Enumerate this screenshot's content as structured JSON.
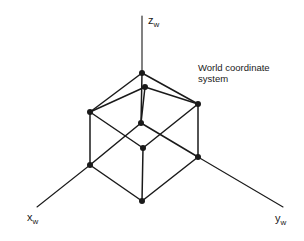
{
  "diagram": {
    "title": "World coordinate system",
    "caption_lines": [
      "World coordinate",
      "system"
    ],
    "axes": {
      "z": {
        "base": "z",
        "sub": "w",
        "label": "z_w",
        "from": [
          142,
          73
        ],
        "to": [
          142,
          16
        ]
      },
      "x": {
        "base": "x",
        "sub": "w",
        "label": "x_w",
        "from": [
          90,
          165
        ],
        "to": [
          37,
          207
        ]
      },
      "y": {
        "base": "y",
        "sub": "w",
        "label": "y_w",
        "from": [
          198,
          157
        ],
        "to": [
          283,
          207
        ]
      }
    },
    "vertices": [
      {
        "id": "T",
        "x": 142,
        "y": 73
      },
      {
        "id": "I",
        "x": 145,
        "y": 87
      },
      {
        "id": "L",
        "x": 90,
        "y": 112
      },
      {
        "id": "R",
        "x": 198,
        "y": 104
      },
      {
        "id": "B",
        "x": 141,
        "y": 123
      },
      {
        "id": "C",
        "x": 143,
        "y": 148
      },
      {
        "id": "LB",
        "x": 90,
        "y": 165
      },
      {
        "id": "RB",
        "x": 198,
        "y": 157
      },
      {
        "id": "D",
        "x": 142,
        "y": 201
      }
    ],
    "edges": [
      [
        "T",
        "L"
      ],
      [
        "T",
        "R"
      ],
      [
        "I",
        "L"
      ],
      [
        "I",
        "R"
      ],
      [
        "T",
        "B"
      ],
      [
        "I",
        "B"
      ],
      [
        "L",
        "C"
      ],
      [
        "R",
        "C"
      ],
      [
        "B",
        "LB"
      ],
      [
        "B",
        "RB"
      ],
      [
        "L",
        "LB"
      ],
      [
        "R",
        "RB"
      ],
      [
        "C",
        "D"
      ],
      [
        "LB",
        "D"
      ],
      [
        "RB",
        "D"
      ]
    ],
    "colors": {
      "stroke": "#1a1a1a",
      "background": "#ffffff"
    }
  }
}
